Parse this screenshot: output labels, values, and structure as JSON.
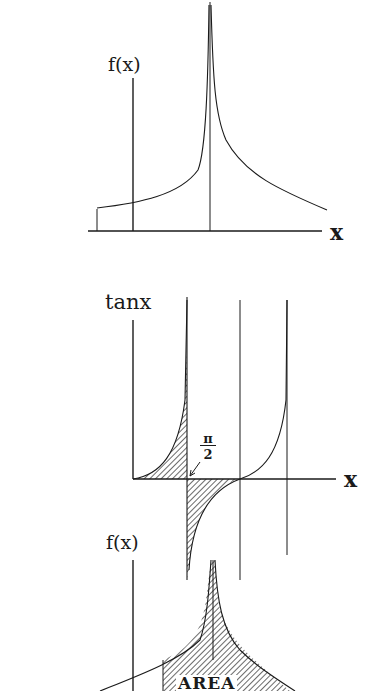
{
  "panels": [
    {
      "id": "top",
      "y_label": "f(x)",
      "x_label": "x",
      "description": "Function with a cusp-like spike rising to infinity at a vertical asymptote"
    },
    {
      "id": "middle",
      "y_label": "tanx",
      "x_label": "x",
      "annotation_num": "π",
      "annotation_den": "2",
      "description": "tan x with shaded areas above and below the axis around π/2 and vertical asymptotes"
    },
    {
      "id": "bottom",
      "y_label": "f(x)",
      "area_label": "AREA",
      "description": "Shaded area under a spiked function"
    }
  ],
  "colors": {
    "ink": "#1a1a1a",
    "paper": "#ffffff"
  }
}
